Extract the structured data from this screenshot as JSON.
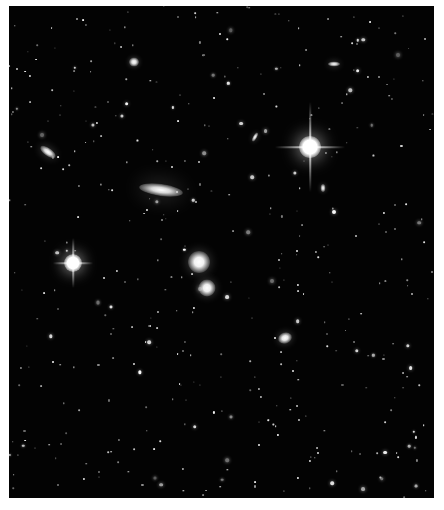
{
  "image": {
    "subject": "deep-sky field of stars and galaxies",
    "background_color": "#030303",
    "frame_color": "#ffffff"
  },
  "bright_stars": [
    {
      "name": "bright-star-right",
      "x": 310,
      "y": 147,
      "r": 11,
      "spike_h": 70,
      "spike_v": 90
    },
    {
      "name": "bright-star-left",
      "x": 73,
      "y": 263,
      "r": 9,
      "spike_h": 40,
      "spike_v": 50
    }
  ],
  "galaxies": [
    {
      "name": "spiral-galaxy-edge-on",
      "x": 161,
      "y": 190,
      "w": 44,
      "h": 12,
      "rot": 8,
      "color": "#d8d8d8"
    },
    {
      "name": "elliptical-galaxy-upper",
      "x": 199,
      "y": 262,
      "w": 22,
      "h": 22,
      "rot": 0,
      "color": "#f2f2f2"
    },
    {
      "name": "elliptical-galaxy-lower",
      "x": 207,
      "y": 288,
      "w": 17,
      "h": 17,
      "rot": 0,
      "color": "#eeeeee"
    },
    {
      "name": "galaxy-left-elongated",
      "x": 48,
      "y": 152,
      "w": 18,
      "h": 8,
      "rot": 35,
      "color": "#dddddd"
    },
    {
      "name": "galaxy-lower-right",
      "x": 285,
      "y": 338,
      "w": 14,
      "h": 11,
      "rot": -20,
      "color": "#e6e6e6"
    },
    {
      "name": "galaxy-top-center",
      "x": 134,
      "y": 62,
      "w": 10,
      "h": 9,
      "rot": 0,
      "color": "#e0e0e0"
    },
    {
      "name": "galaxy-top-right",
      "x": 334,
      "y": 64,
      "w": 12,
      "h": 5,
      "rot": 0,
      "color": "#cfcfcf"
    },
    {
      "name": "galaxy-small-tilted",
      "x": 255,
      "y": 137,
      "w": 10,
      "h": 4,
      "rot": -60,
      "color": "#d0d0d0"
    },
    {
      "name": "galaxy-near-bright-star",
      "x": 323,
      "y": 188,
      "w": 5,
      "h": 8,
      "rot": 0,
      "color": "#cccccc"
    }
  ],
  "star_seed": 7
}
